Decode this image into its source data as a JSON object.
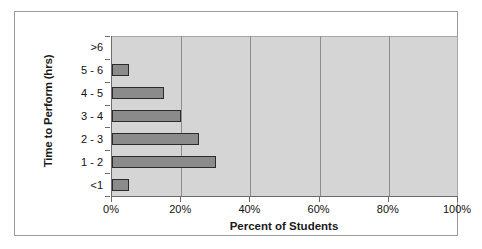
{
  "chart_data": {
    "type": "bar",
    "orientation": "horizontal",
    "title": "",
    "xlabel": "Percent of Students",
    "ylabel": "Time to Perform (hrs)",
    "categories": [
      ">6",
      "5 - 6",
      "4 - 5",
      "3 - 4",
      "2 - 3",
      "1 - 2",
      "<1"
    ],
    "values": [
      0,
      5,
      15,
      20,
      25,
      30,
      5
    ],
    "value_unit": "%",
    "xlim": [
      0,
      100
    ],
    "xticks": [
      0,
      20,
      40,
      60,
      80,
      100
    ],
    "xtick_labels": [
      "0%",
      "20%",
      "40%",
      "60%",
      "80%",
      "100%"
    ],
    "grid": "vertical",
    "legend": "none",
    "bar_color": "#8b8b8b",
    "bar_edge_color": "#2b2b2b",
    "plot_background": "#d5d5d5",
    "figure_background": "#ffffff",
    "gridline_color": "#8d8d8d",
    "axis_color": "#6b6b6b"
  }
}
